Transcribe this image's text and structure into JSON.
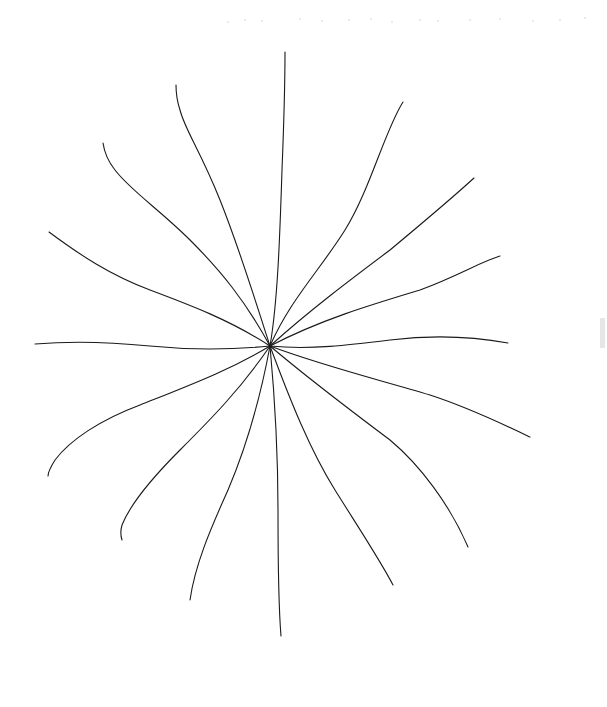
{
  "drawing": {
    "subject": "hand-drawn starburst of 16 curved rays",
    "stroke_color": "#1a1a1a",
    "background": "#ffffff",
    "center": [
      270,
      346
    ],
    "rays": [
      {
        "name": "ray-north",
        "d": "M270,346 C278,300 280,230 282,170 C284,120 285,80 285,52"
      },
      {
        "name": "ray-north-northwest",
        "d": "M270,346 C255,300 240,250 220,200 C200,150 185,130 180,110 C176,98 176,90 176,85"
      },
      {
        "name": "ray-northwest",
        "d": "M270,346 C245,300 220,270 190,240 C160,210 130,190 115,170 C107,160 104,150 103,143"
      },
      {
        "name": "ray-west-northwest",
        "d": "M270,346 C230,320 190,305 150,290 C110,275 80,255 49,232"
      },
      {
        "name": "ray-west",
        "d": "M270,346 C230,350 190,350 150,346 C110,342 70,341 35,344"
      },
      {
        "name": "ray-west-southwest",
        "d": "M270,346 C230,370 190,385 140,405 C100,420 70,440 55,460 C50,468 48,473 48,476"
      },
      {
        "name": "ray-southwest",
        "d": "M270,346 C240,390 210,420 180,450 C150,480 130,505 122,525 C120,532 121,537 122,540"
      },
      {
        "name": "ray-south-southwest",
        "d": "M270,346 C260,400 245,450 228,490 C210,530 195,565 190,600"
      },
      {
        "name": "ray-south",
        "d": "M270,346 C275,400 278,450 278,510 C278,560 278,600 281,636"
      },
      {
        "name": "ray-south-southeast",
        "d": "M270,346 C290,400 310,450 335,490 C360,530 380,560 393,585"
      },
      {
        "name": "ray-southeast",
        "d": "M270,346 C310,380 350,410 390,440 C420,465 450,505 468,547"
      },
      {
        "name": "ray-east-southeast",
        "d": "M270,346 C320,365 380,380 430,395 C470,408 505,425 530,437"
      },
      {
        "name": "ray-east",
        "d": "M270,346 C310,350 350,345 390,340 C430,335 470,336 508,343"
      },
      {
        "name": "ray-east-northeast",
        "d": "M270,346 C320,320 370,305 420,290 C460,275 480,262 500,256"
      },
      {
        "name": "ray-northeast",
        "d": "M270,346 C310,310 350,280 390,250 C420,225 450,200 474,178"
      },
      {
        "name": "ray-north-northeast",
        "d": "M270,346 C290,300 320,270 345,230 C370,190 385,130 403,102"
      }
    ],
    "scanner_specks": [
      [
        228,
        22
      ],
      [
        245,
        20
      ],
      [
        262,
        21
      ],
      [
        300,
        19
      ],
      [
        322,
        21
      ],
      [
        349,
        20
      ],
      [
        371,
        19
      ],
      [
        392,
        22
      ],
      [
        420,
        20
      ],
      [
        438,
        21
      ],
      [
        470,
        20
      ],
      [
        500,
        19
      ],
      [
        533,
        21
      ],
      [
        560,
        20
      ],
      [
        585,
        18
      ]
    ]
  }
}
